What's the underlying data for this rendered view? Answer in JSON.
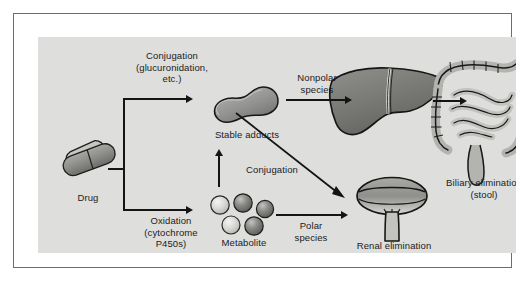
{
  "figure": {
    "type": "flow-diagram",
    "background_color": "#dededc",
    "frame_color": "#6d6d6d",
    "ink_color": "#141414"
  },
  "nodes": {
    "drug": {
      "label": "Drug",
      "icon": "capsule-pill-icon",
      "x": 52,
      "y": 122
    },
    "stable_adducts": {
      "label": "Stable adducts",
      "icon": "adduct-blob-icon",
      "x": 211,
      "y": 100
    },
    "metabolite": {
      "label": "Metabolite",
      "icon": "metabolite-spheres-icon",
      "sphere_count": 5,
      "x": 211,
      "y": 190
    },
    "liver": {
      "label": "",
      "icon": "liver-icon",
      "x": 350,
      "y": 80
    },
    "intestine": {
      "label": "Biliary elimination\n(stool)",
      "icon": "intestine-icon",
      "x": 458,
      "y": 90
    },
    "bladder": {
      "label": "Renal elimination\n(urine)",
      "icon": "bladder-icon",
      "x": 354,
      "y": 185
    }
  },
  "edge_labels": {
    "conjugation_top": "Conjugation\n(glucuronidation,\netc.)",
    "oxidation": "Oxidation\n(cytochrome\nP450s)",
    "nonpolar_species": "Nonpolar\nspecies",
    "conjugation_middle": "Conjugation",
    "polar_species": "Polar\nspecies"
  },
  "captions": {
    "biliary": "Biliary elimination\n(stool)",
    "renal": "Renal elimination\n(urine)"
  },
  "colors": {
    "canvas": "#dededc",
    "ink": "#141414",
    "organ_fill_dark": "#6e6e6e",
    "organ_fill_mid": "#9a9a9a",
    "organ_fill_light": "#c9c9c9",
    "sphere_light": "#cfcfcf",
    "sphere_dark": "#777777"
  }
}
